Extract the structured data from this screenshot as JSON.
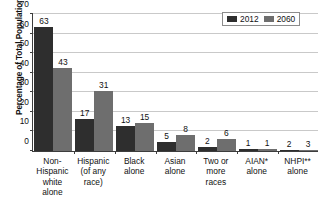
{
  "chart_data": {
    "type": "bar",
    "title": "",
    "subtitle": "",
    "xlabel": "",
    "ylabel": "Percentage of Total Population",
    "ylim": [
      0,
      70
    ],
    "yticks": [
      0,
      10,
      20,
      30,
      40,
      50,
      60,
      70
    ],
    "ytick_labels": [
      "0",
      "10",
      "20",
      "30",
      "40",
      "50",
      "60",
      "70"
    ],
    "grid": "horizontal",
    "legend_position": "top-right",
    "categories": [
      "Non-Hispanic white alone",
      "Hispanic (of any race)",
      "Black alone",
      "Asian alone",
      "Two or more races",
      "AIAN* alone",
      "NHPI** alone"
    ],
    "category_lines": [
      [
        "Non-",
        "Hispanic",
        "white",
        "alone"
      ],
      [
        "Hispanic",
        "(of any",
        "race)"
      ],
      [
        "Black",
        "alone"
      ],
      [
        "Asian",
        "alone"
      ],
      [
        "Two or",
        "more",
        "races"
      ],
      [
        "AIAN*",
        "alone"
      ],
      [
        "NHPI**",
        "alone"
      ]
    ],
    "series": [
      {
        "name": "2012",
        "color": "#2e2e2e",
        "values": [
          63,
          17,
          13,
          5,
          2,
          1,
          2
        ],
        "plotted_values": [
          63.4,
          16.3,
          12.7,
          4.8,
          1.8,
          0.8,
          0.3
        ],
        "labels": [
          "63",
          "17",
          "13",
          "5",
          "2",
          "1",
          "2"
        ]
      },
      {
        "name": "2060",
        "color": "#6e6e6e",
        "values": [
          43,
          31,
          15,
          8,
          6,
          1,
          3
        ],
        "plotted_values": [
          42.6,
          30.6,
          14.4,
          8.0,
          6.1,
          1.0,
          0.4
        ],
        "labels": [
          "43",
          "31",
          "15",
          "8",
          "6",
          "1",
          "3"
        ]
      }
    ]
  },
  "legend": {
    "entries": [
      {
        "label": "2012",
        "color": "#2e2e2e"
      },
      {
        "label": "2060",
        "color": "#6e6e6e"
      }
    ]
  },
  "colors": {
    "series_2012": "#2e2e2e",
    "series_2060": "#6e6e6e",
    "grid": "#c9c9c9",
    "axis": "#3d3d3d",
    "background": "#ffffff",
    "text": "#111111"
  }
}
